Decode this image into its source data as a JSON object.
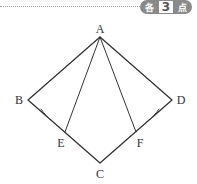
{
  "header": {
    "badge": {
      "prefix": "各",
      "number": "3",
      "suffix": "点"
    }
  },
  "diagram": {
    "points": {
      "A": {
        "label": "A",
        "x": 100,
        "y": 37
      },
      "B": {
        "label": "B",
        "x": 28,
        "y": 100
      },
      "C": {
        "label": "C",
        "x": 100,
        "y": 163
      },
      "D": {
        "label": "D",
        "x": 172,
        "y": 100
      },
      "E": {
        "label": "E",
        "x": 65,
        "y": 132
      },
      "F": {
        "label": "F",
        "x": 136,
        "y": 132
      }
    },
    "segments": [
      "AB",
      "AD",
      "BC",
      "DC",
      "AE",
      "AF"
    ],
    "equal_marks": [
      "BE",
      "DF"
    ],
    "colors": {
      "line": "#333333",
      "badge": "#8a8a8a"
    }
  }
}
